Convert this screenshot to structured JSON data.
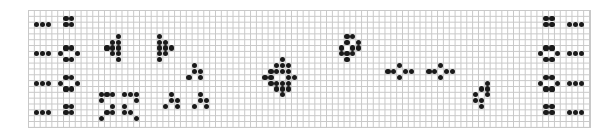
{
  "board": {
    "cols": 96,
    "rows": 20,
    "cell_px": 5.85,
    "origin": [
      28,
      10
    ],
    "grid_color": "#c8c8c8",
    "live_color": "#1a1a1a",
    "background": "#ffffff",
    "live_cells": [
      [
        1,
        2
      ],
      [
        2,
        2
      ],
      [
        3,
        2
      ],
      [
        1,
        7
      ],
      [
        2,
        7
      ],
      [
        3,
        7
      ],
      [
        1,
        12
      ],
      [
        2,
        12
      ],
      [
        3,
        12
      ],
      [
        1,
        17
      ],
      [
        2,
        17
      ],
      [
        3,
        17
      ],
      [
        6,
        1
      ],
      [
        7,
        1
      ],
      [
        6,
        2
      ],
      [
        7,
        2
      ],
      [
        6,
        6
      ],
      [
        7,
        6
      ],
      [
        5,
        7
      ],
      [
        8,
        7
      ],
      [
        6,
        8
      ],
      [
        7,
        8
      ],
      [
        6,
        11
      ],
      [
        7,
        11
      ],
      [
        5,
        12
      ],
      [
        8,
        12
      ],
      [
        6,
        13
      ],
      [
        7,
        13
      ],
      [
        6,
        16
      ],
      [
        7,
        16
      ],
      [
        6,
        17
      ],
      [
        7,
        17
      ],
      [
        15,
        4
      ],
      [
        14,
        5
      ],
      [
        15,
        5
      ],
      [
        13,
        6
      ],
      [
        14,
        6
      ],
      [
        15,
        6
      ],
      [
        14,
        7
      ],
      [
        15,
        7
      ],
      [
        15,
        8
      ],
      [
        22,
        4
      ],
      [
        22,
        5
      ],
      [
        23,
        5
      ],
      [
        22,
        6
      ],
      [
        23,
        6
      ],
      [
        24,
        6
      ],
      [
        22,
        7
      ],
      [
        23,
        7
      ],
      [
        22,
        8
      ],
      [
        12,
        14
      ],
      [
        13,
        14
      ],
      [
        14,
        14
      ],
      [
        16,
        14
      ],
      [
        17,
        14
      ],
      [
        18,
        14
      ],
      [
        12,
        15
      ],
      [
        18,
        15
      ],
      [
        14,
        16
      ],
      [
        16,
        16
      ],
      [
        13,
        17
      ],
      [
        14,
        17
      ],
      [
        16,
        17
      ],
      [
        17,
        17
      ],
      [
        12,
        18
      ],
      [
        18,
        18
      ],
      [
        28,
        9
      ],
      [
        28,
        10
      ],
      [
        29,
        10
      ],
      [
        27,
        11
      ],
      [
        29,
        11
      ],
      [
        24,
        14
      ],
      [
        24,
        15
      ],
      [
        25,
        15
      ],
      [
        23,
        16
      ],
      [
        25,
        16
      ],
      [
        29,
        14
      ],
      [
        29,
        15
      ],
      [
        30,
        15
      ],
      [
        28,
        16
      ],
      [
        30,
        16
      ],
      [
        43,
        8
      ],
      [
        42,
        9
      ],
      [
        43,
        9
      ],
      [
        44,
        9
      ],
      [
        41,
        10
      ],
      [
        42,
        10
      ],
      [
        43,
        10
      ],
      [
        44,
        10
      ],
      [
        40,
        11
      ],
      [
        41,
        11
      ],
      [
        44,
        11
      ],
      [
        45,
        11
      ],
      [
        41,
        12
      ],
      [
        42,
        12
      ],
      [
        43,
        12
      ],
      [
        44,
        12
      ],
      [
        42,
        13
      ],
      [
        43,
        13
      ],
      [
        44,
        13
      ],
      [
        43,
        14
      ],
      [
        54,
        4
      ],
      [
        55,
        4
      ],
      [
        54,
        5
      ],
      [
        56,
        5
      ],
      [
        53,
        6
      ],
      [
        55,
        6
      ],
      [
        56,
        6
      ],
      [
        53,
        7
      ],
      [
        54,
        7
      ],
      [
        55,
        7
      ],
      [
        54,
        8
      ],
      [
        61,
        10
      ],
      [
        62,
        10
      ],
      [
        64,
        10
      ],
      [
        65,
        10
      ],
      [
        63,
        9
      ],
      [
        63,
        11
      ],
      [
        68,
        10
      ],
      [
        69,
        10
      ],
      [
        71,
        10
      ],
      [
        72,
        10
      ],
      [
        70,
        9
      ],
      [
        70,
        11
      ],
      [
        78,
        12
      ],
      [
        77,
        13
      ],
      [
        78,
        13
      ],
      [
        76,
        14
      ],
      [
        78,
        14
      ],
      [
        76,
        15
      ],
      [
        77,
        15
      ],
      [
        77,
        16
      ],
      [
        88,
        1
      ],
      [
        89,
        1
      ],
      [
        88,
        2
      ],
      [
        89,
        2
      ],
      [
        88,
        6
      ],
      [
        89,
        6
      ],
      [
        87,
        7
      ],
      [
        90,
        7
      ],
      [
        88,
        8
      ],
      [
        89,
        8
      ],
      [
        88,
        11
      ],
      [
        89,
        11
      ],
      [
        87,
        12
      ],
      [
        90,
        12
      ],
      [
        88,
        13
      ],
      [
        89,
        13
      ],
      [
        88,
        16
      ],
      [
        89,
        16
      ],
      [
        88,
        17
      ],
      [
        89,
        17
      ],
      [
        92,
        2
      ],
      [
        93,
        2
      ],
      [
        94,
        2
      ],
      [
        92,
        7
      ],
      [
        93,
        7
      ],
      [
        94,
        7
      ],
      [
        92,
        12
      ],
      [
        93,
        12
      ],
      [
        94,
        12
      ],
      [
        92,
        17
      ],
      [
        93,
        17
      ],
      [
        94,
        17
      ]
    ]
  }
}
